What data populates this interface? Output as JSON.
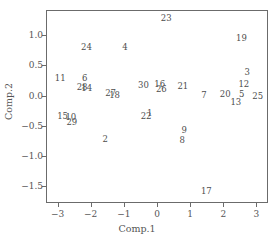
{
  "chart_data": {
    "type": "scatter",
    "title": "",
    "xlabel": "Comp.1",
    "ylabel": "Comp.2",
    "xlim": [
      -3.35,
      3.35
    ],
    "ylim": [
      -1.78,
      1.42
    ],
    "grid": false,
    "legend": null,
    "marker_style": "text-label",
    "xticks": [
      -3,
      -2,
      -1,
      0,
      1,
      2,
      3
    ],
    "xticklabels": [
      "−3",
      "−2",
      "−1",
      "0",
      "1",
      "2",
      "3"
    ],
    "yticks": [
      1.0,
      0.5,
      0.0,
      -0.5,
      -1.0,
      -1.5
    ],
    "yticklabels": [
      "1.0",
      "0.5",
      "0.0",
      "−0.5",
      "−1.0",
      "−1.5"
    ],
    "points": [
      {
        "label": "1",
        "x": -0.22,
        "y": -0.28
      },
      {
        "label": "2",
        "x": -1.56,
        "y": -0.72
      },
      {
        "label": "3",
        "x": 2.72,
        "y": 0.4
      },
      {
        "label": "4",
        "x": -0.97,
        "y": 0.81
      },
      {
        "label": "5",
        "x": 2.56,
        "y": 0.03
      },
      {
        "label": "6",
        "x": -2.18,
        "y": 0.3
      },
      {
        "label": "7",
        "x": 1.42,
        "y": 0.01
      },
      {
        "label": "8",
        "x": 0.76,
        "y": -0.73
      },
      {
        "label": "9",
        "x": 0.82,
        "y": -0.57
      },
      {
        "label": "10",
        "x": -2.6,
        "y": -0.36
      },
      {
        "label": "11",
        "x": -2.92,
        "y": 0.29
      },
      {
        "label": "12",
        "x": 2.62,
        "y": 0.19
      },
      {
        "label": "13",
        "x": 2.38,
        "y": -0.1
      },
      {
        "label": "14",
        "x": -2.12,
        "y": 0.12
      },
      {
        "label": "15",
        "x": -2.85,
        "y": -0.33
      },
      {
        "label": "16",
        "x": 0.08,
        "y": 0.19
      },
      {
        "label": "17",
        "x": 1.49,
        "y": -1.58
      },
      {
        "label": "18",
        "x": -1.28,
        "y": 0.01
      },
      {
        "label": "19",
        "x": 2.55,
        "y": 0.95
      },
      {
        "label": "20",
        "x": 2.06,
        "y": 0.03
      },
      {
        "label": "21",
        "x": 0.78,
        "y": 0.16
      },
      {
        "label": "22",
        "x": -0.33,
        "y": -0.33
      },
      {
        "label": "23",
        "x": 0.28,
        "y": 1.28
      },
      {
        "label": "24",
        "x": -2.13,
        "y": 0.81
      },
      {
        "label": "25",
        "x": 3.04,
        "y": 0.0
      },
      {
        "label": "26",
        "x": 0.13,
        "y": 0.11
      },
      {
        "label": "27",
        "x": -1.4,
        "y": 0.05
      },
      {
        "label": "28",
        "x": -2.26,
        "y": 0.15
      },
      {
        "label": "29",
        "x": -2.57,
        "y": -0.43
      },
      {
        "label": "30",
        "x": -0.41,
        "y": 0.17
      }
    ]
  }
}
